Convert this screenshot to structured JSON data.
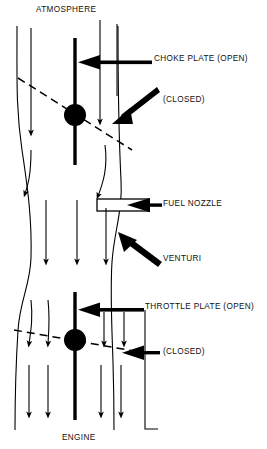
{
  "diagram": {
    "top_label": "ATMOSPHERE",
    "bottom_label": "ENGINE",
    "stroke_color": "#000000",
    "background_color": "#ffffff",
    "callouts": [
      {
        "key": "choke_open",
        "text": "CHOKE PLATE (OPEN)"
      },
      {
        "key": "choke_closed",
        "text": "(CLOSED)"
      },
      {
        "key": "fuel_nozzle",
        "text": "FUEL NOZZLE"
      },
      {
        "key": "venturi",
        "text": "VENTURI"
      },
      {
        "key": "throttle_open",
        "text": "THROTTLE PLATE (OPEN)"
      },
      {
        "key": "throttle_closed",
        "text": "(CLOSED)"
      }
    ],
    "labels": {
      "choke_open": "CHOKE PLATE (OPEN)",
      "choke_closed": "(CLOSED)",
      "fuel_nozzle": "FUEL NOZZLE",
      "venturi": "VENTURI",
      "throttle_open": "THROTTLE PLATE (OPEN)",
      "throttle_closed": "(CLOSED)"
    },
    "parts": [
      "choke plate shaft",
      "choke plate pivot hub",
      "choke plate open position",
      "choke plate closed position",
      "fuel nozzle",
      "venturi throat",
      "throttle plate shaft",
      "throttle plate pivot hub",
      "throttle plate closed position",
      "airflow arrows",
      "carburetor bore walls"
    ],
    "airflow_direction": "downward from atmosphere to engine"
  }
}
